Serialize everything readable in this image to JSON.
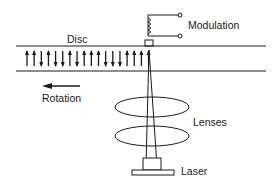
{
  "diagram": {
    "type": "magneto-optical recording schematic",
    "labels": {
      "disc": "Disc",
      "modulation": "Modulation",
      "rotation": "Rotation",
      "lenses": "Lenses",
      "laser": "Laser"
    },
    "magnetic_domains": [
      "up",
      "up",
      "down",
      "up",
      "down",
      "down",
      "up",
      "down",
      "up",
      "up",
      "up",
      "down",
      "down",
      "down",
      "up",
      "up",
      "up",
      "up"
    ],
    "colors": {
      "ink": "#1a1a1a",
      "background": "#ffffff"
    }
  }
}
